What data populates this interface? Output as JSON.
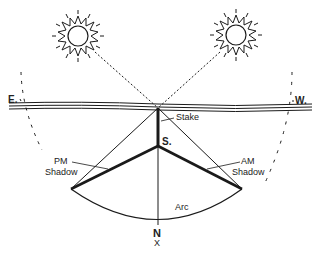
{
  "diagram": {
    "type": "sun-shadow-direction-finding",
    "colors": {
      "ink": "#1a1a1a",
      "background": "#ffffff"
    },
    "labels": {
      "east": "E.",
      "west": "W.",
      "stake": "Stake",
      "stake_base": "S.",
      "pm_shadow_1": "PM",
      "pm_shadow_2": "Shadow",
      "am_shadow_1": "AM",
      "am_shadow_2": "Shadow",
      "arc": "Arc",
      "north": "N",
      "north_mark": "X"
    },
    "elements": [
      "left-sun-icon",
      "right-sun-icon",
      "horizon",
      "stake",
      "pm-shadow",
      "am-shadow",
      "arc",
      "north-line"
    ]
  }
}
